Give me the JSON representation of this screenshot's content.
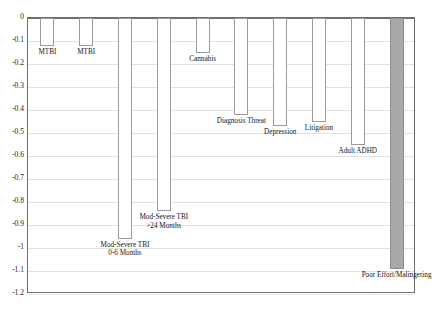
{
  "chart_data": {
    "type": "bar",
    "title": "",
    "subtitle": "",
    "xlabel": "",
    "ylabel": "",
    "ylim": [
      -1.2,
      0
    ],
    "xlim": [
      0,
      10
    ],
    "grid": true,
    "legend": null,
    "orientation": "vertical",
    "bar_fill_default": "#ffffff",
    "bar_outline_default": "#9a9a9a",
    "highlight_fill": "#a8a8a8",
    "categories": [
      "MTBI",
      "MTBI",
      "Mod-Severe TBI 0-6 Months",
      "Mod-Severe TBI >24 Months",
      "Cannabis",
      "Diagnosis Threat",
      "Depression",
      "Litigation",
      "Adult ADHD",
      "Poor Effort/Malingering"
    ],
    "values": [
      -0.12,
      -0.12,
      -0.96,
      -0.84,
      -0.15,
      -0.42,
      -0.47,
      -0.45,
      -0.55,
      -1.09
    ],
    "ytick_labels": [
      "0",
      "-0.1",
      "-0.2",
      "-0.3",
      "-0.4",
      "-0.5",
      "-0.6",
      "-0.7",
      "-0.8",
      "-0.9",
      "-1",
      "-1.1",
      "-1.2"
    ],
    "ytick_values": [
      0,
      -0.1,
      -0.2,
      -0.3,
      -0.4,
      -0.5,
      -0.6,
      -0.7,
      -0.8,
      -0.9,
      -1,
      -1.1,
      -1.2
    ],
    "bars": [
      {
        "label_line1": "MTBI",
        "label_line2": "",
        "value": -0.12,
        "highlight": false
      },
      {
        "label_line1": "MTBI",
        "label_line2": "",
        "value": -0.12,
        "highlight": false
      },
      {
        "label_line1": "Mod-Severe TBI",
        "label_line2": "0-6 Months",
        "value": -0.96,
        "highlight": false
      },
      {
        "label_line1": "Mod-Severe TBI",
        "label_line2": ">24 Months",
        "value": -0.84,
        "highlight": false
      },
      {
        "label_line1": "Cannabis",
        "label_line2": "",
        "value": -0.15,
        "highlight": false
      },
      {
        "label_line1": "Diagnosis Threat",
        "label_line2": "",
        "value": -0.42,
        "highlight": false
      },
      {
        "label_line1": "Depression",
        "label_line2": "",
        "value": -0.47,
        "highlight": false
      },
      {
        "label_line1": "Litigation",
        "label_line2": "",
        "value": -0.45,
        "highlight": false
      },
      {
        "label_line1": "Adult ADHD",
        "label_line2": "",
        "value": -0.55,
        "highlight": false
      },
      {
        "label_line1": "Poor Effort/Malingering",
        "label_line2": "",
        "value": -1.09,
        "highlight": true
      }
    ]
  }
}
